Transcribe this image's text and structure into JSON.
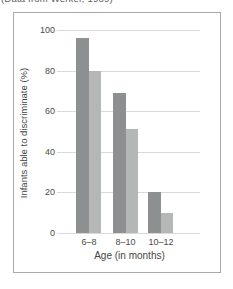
{
  "caption": "(Data from Werker, 1989)",
  "colors": {
    "bar_dark": "#8d9091",
    "bar_light": "#b5b7b7",
    "gridline": "#d9d9d7",
    "frame_border": "#a9a9a7",
    "text": "#4a4a48"
  },
  "chart_data": {
    "type": "bar",
    "title": "",
    "categories": [
      "6–8",
      "8–10",
      "10–12"
    ],
    "series": [
      {
        "name": "dark-gray-bars",
        "color": "#8d9091",
        "values": [
          96,
          69,
          20
        ]
      },
      {
        "name": "light-gray-bars",
        "color": "#b5b7b7",
        "values": [
          80,
          51,
          10
        ]
      }
    ],
    "xlabel": "Age (in months)",
    "ylabel": "Infants able to discriminate (%)",
    "ylim": [
      0,
      100
    ],
    "yticks": [
      0,
      20,
      40,
      60,
      80,
      100
    ],
    "grid": true,
    "legend": "none"
  }
}
